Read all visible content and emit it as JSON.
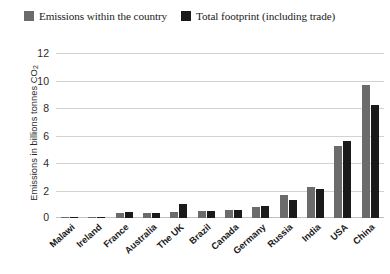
{
  "legend": {
    "position": "top-left",
    "entries": [
      {
        "label": "Emissions within the country",
        "color": "#6b6b6b",
        "key": "within"
      },
      {
        "label": "Total footprint (including trade)",
        "color": "#1a1a1a",
        "key": "total"
      }
    ]
  },
  "axes": {
    "ylabel_main": "Emissions in billions tonnes CO",
    "ylabel_sub": "2",
    "ylabel_full": "Emissions in billions tonnes CO2",
    "xlabel": "",
    "yticks": [
      "12",
      "10",
      "8",
      "6",
      "4",
      "2",
      "0"
    ],
    "ymin": 0,
    "ymax": 12,
    "grid": true
  },
  "chart_data": {
    "type": "bar",
    "title": "",
    "subtitle": "",
    "xlabel": "",
    "ylabel": "Emissions in billions tonnes CO2",
    "ylim": [
      0,
      12
    ],
    "yticks": [
      0,
      2,
      4,
      6,
      8,
      10,
      12
    ],
    "grid": true,
    "legend_position": "top-left",
    "categories": [
      "Malawi",
      "Ireland",
      "France",
      "Australia",
      "The UK",
      "Brazil",
      "Canada",
      "Germany",
      "Russia",
      "India",
      "USA",
      "China"
    ],
    "series": [
      {
        "name": "Emissions within the country",
        "color": "#6b6b6b",
        "values": [
          0.02,
          0.04,
          0.35,
          0.4,
          0.45,
          0.5,
          0.55,
          0.8,
          1.7,
          2.3,
          5.3,
          9.7
        ]
      },
      {
        "name": "Total footprint (including trade)",
        "color": "#1a1a1a",
        "values": [
          0.03,
          0.05,
          0.45,
          0.4,
          1.0,
          0.5,
          0.6,
          0.9,
          1.3,
          2.1,
          5.6,
          8.3
        ]
      }
    ]
  }
}
